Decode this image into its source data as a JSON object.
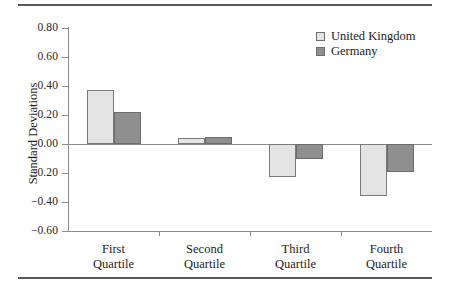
{
  "chart_data": {
    "type": "bar",
    "title": "",
    "subtitle": "",
    "xlabel": "",
    "ylabel": "Standard Deviations",
    "ylim": [
      -0.6,
      0.8
    ],
    "ytick_values": [
      0.8,
      0.6,
      0.4,
      0.2,
      0.0,
      -0.2,
      -0.4,
      -0.6
    ],
    "ytick_labels": [
      "0.80",
      "0.60",
      "0.40",
      "0.20",
      "0.00",
      "-0.20",
      "-0.40",
      "-0.60"
    ],
    "grid": false,
    "legend_position": "top-right",
    "categories": [
      "First Quartile",
      "Second Quartile",
      "Third Quartile",
      "Fourth Quartile"
    ],
    "category_lines": [
      [
        "First",
        "Quartile"
      ],
      [
        "Second",
        "Quartile"
      ],
      [
        "Third",
        "Quartile"
      ],
      [
        "Fourth",
        "Quartile"
      ]
    ],
    "series": [
      {
        "name": "United Kingdom",
        "color": "#e4e4e4",
        "border_color": "#7a7a7a",
        "values": [
          0.37,
          0.04,
          -0.23,
          -0.36
        ]
      },
      {
        "name": "Germany",
        "color": "#8f8f8f",
        "border_color": "#6b6b6b",
        "values": [
          0.22,
          0.05,
          -0.1,
          -0.19
        ]
      }
    ]
  },
  "legend": {
    "items": [
      {
        "label": "United Kingdom",
        "swatch": "uk"
      },
      {
        "label": "Germany",
        "swatch": "de"
      }
    ]
  },
  "axis": {
    "y_label": "Standard Deviations"
  }
}
